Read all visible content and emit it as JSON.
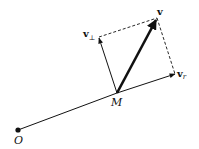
{
  "diagram": {
    "type": "vector-decomposition",
    "colors": {
      "ink": "#111111",
      "background": "#ffffff"
    },
    "points": {
      "origin": {
        "label": "O",
        "x": 18,
        "y": 130
      },
      "m": {
        "label": "M",
        "x": 117,
        "y": 93
      }
    },
    "vectors": {
      "v": {
        "label": "v",
        "x": 157,
        "y": 18
      },
      "v_r": {
        "label": "v",
        "subscript": "r",
        "x": 175,
        "y": 75
      },
      "v_perp": {
        "label": "v",
        "subscript": "⊥",
        "x": 99,
        "y": 37
      }
    }
  }
}
